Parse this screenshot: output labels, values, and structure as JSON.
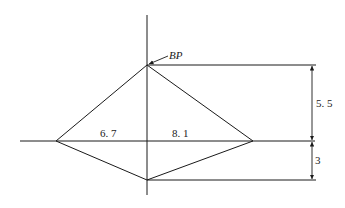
{
  "diagram": {
    "type": "geometric-dimension-sketch",
    "point_label": "BP",
    "labels": {
      "left_half_width": "6. 7",
      "right_half_width": "8. 1",
      "upper_height": "5. 5",
      "lower_height": "3"
    },
    "values": {
      "left_half_width": 6.7,
      "right_half_width": 8.1,
      "upper_height": 5.5,
      "lower_height": 3
    },
    "shape": "kite (quadrilateral) split by perpendicular axes",
    "vertices": {
      "top": "BP",
      "left": "",
      "right": "",
      "bottom": ""
    },
    "colors": {
      "line": "#1a1a1a",
      "text": "#222222",
      "background": "#ffffff"
    }
  }
}
